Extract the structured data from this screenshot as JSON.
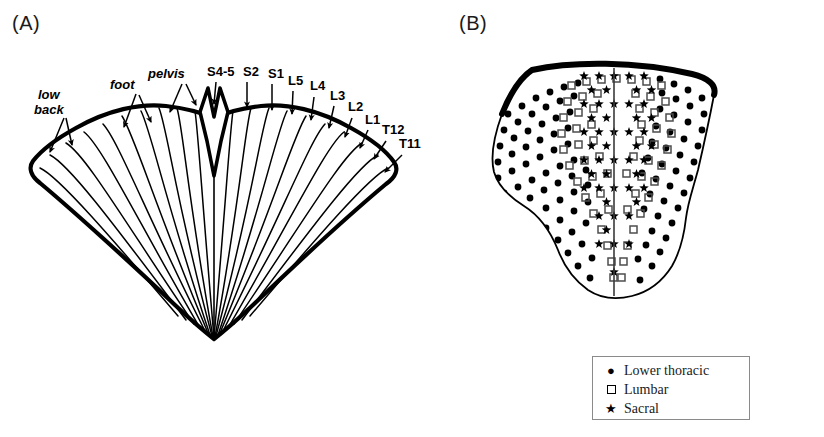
{
  "figure": {
    "background": "#ffffff",
    "ink": "#000000",
    "panels": [
      {
        "id": "A",
        "label": "(A)"
      },
      {
        "id": "B",
        "label": "(B)"
      }
    ]
  },
  "panel_a": {
    "label": "(A)",
    "description": "Fan-shaped butterfly diagram of dermatomal/segmental representation with radiating lines and labelled arrows",
    "region_labels": [
      {
        "text": "low",
        "style": "italic",
        "x": 38,
        "y": 99,
        "anchor": "start"
      },
      {
        "text": "back",
        "style": "italic",
        "x": 34,
        "y": 114,
        "anchor": "start"
      },
      {
        "text": "foot",
        "style": "italic",
        "x": 110,
        "y": 89,
        "anchor": "start"
      },
      {
        "text": "pelvis",
        "style": "italic",
        "x": 148,
        "y": 78,
        "anchor": "start"
      }
    ],
    "segment_labels": [
      {
        "text": "S4-5",
        "x": 207,
        "y": 76
      },
      {
        "text": "S2",
        "x": 243,
        "y": 76
      },
      {
        "text": "S1",
        "x": 268,
        "y": 78
      },
      {
        "text": "L5",
        "x": 288,
        "y": 85
      },
      {
        "text": "L4",
        "x": 310,
        "y": 90
      },
      {
        "text": "L3",
        "x": 330,
        "y": 100
      },
      {
        "text": "L2",
        "x": 348,
        "y": 111
      },
      {
        "text": "L1",
        "x": 365,
        "y": 124
      },
      {
        "text": "T12",
        "x": 382,
        "y": 134
      },
      {
        "text": "T11",
        "x": 399,
        "y": 148
      }
    ],
    "arrow_count": 22,
    "radiating_line_count": 21
  },
  "panel_b": {
    "label": "(B)",
    "description": "Shield-shaped cross-section map showing spatial distribution of marker symbols by spinal level",
    "marker_groups": [
      {
        "key": "lower_thoracic",
        "glyph": "filled-circle",
        "zone": "lateral-periphery"
      },
      {
        "key": "lumbar",
        "glyph": "open-square",
        "zone": "intermediate-band"
      },
      {
        "key": "sacral",
        "glyph": "star",
        "zone": "medial-central"
      }
    ],
    "has_midline": true
  },
  "legend": {
    "items": [
      {
        "glyph": "filled-circle",
        "label": "Lower thoracic"
      },
      {
        "glyph": "open-square",
        "label": "Lumbar"
      },
      {
        "glyph": "star",
        "label": "Sacral"
      }
    ]
  }
}
